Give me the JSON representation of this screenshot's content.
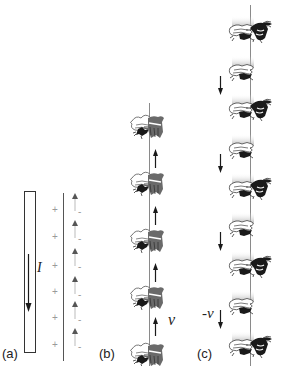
{
  "figure": {
    "panels": [
      {
        "id": "a",
        "label": "(a)",
        "current_label": "I",
        "positive_sign": "+",
        "negative_sign": "-",
        "positive_count": 6,
        "dipole_count": 6
      },
      {
        "id": "b",
        "label": "(b)",
        "velocity_label": "v",
        "molecule_count": 5,
        "arrow_direction": "up",
        "arrow_count": 4
      },
      {
        "id": "c",
        "label": "(c)",
        "velocity_label": "-v",
        "left_molecule_count": 9,
        "right_molecule_count": 5,
        "arrow_direction": "down",
        "arrow_count": 4
      }
    ],
    "colors": {
      "line": "#8a8a8a",
      "ink": "#1a1a1a",
      "sign": "#9a9a9a"
    }
  }
}
